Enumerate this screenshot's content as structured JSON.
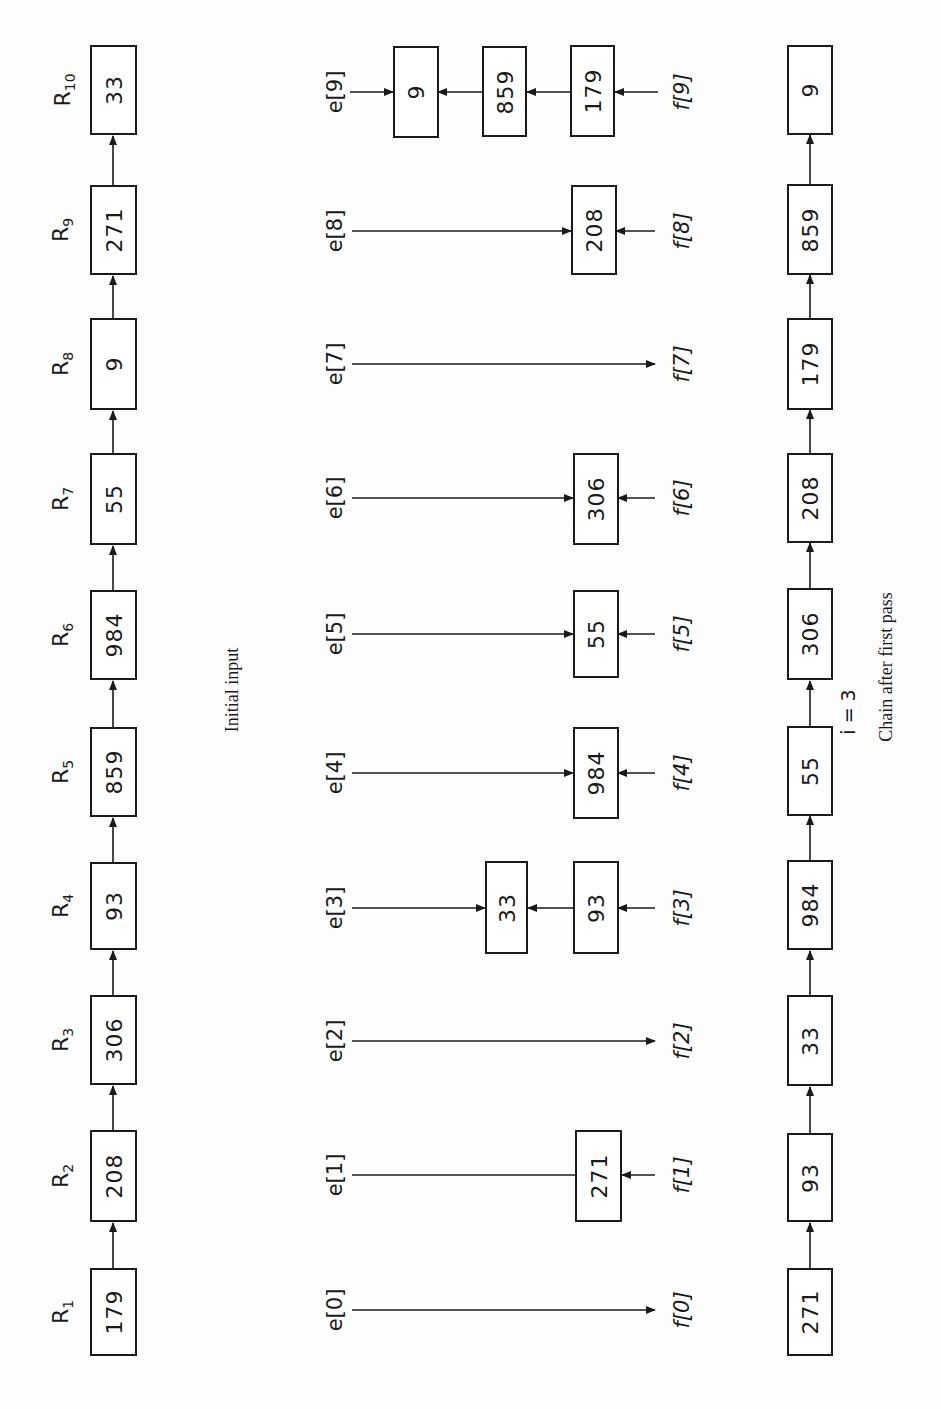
{
  "initial_input": {
    "caption": "Initial input",
    "records": [
      {
        "label": "R",
        "sub": "1",
        "value": "179"
      },
      {
        "label": "R",
        "sub": "2",
        "value": "208"
      },
      {
        "label": "R",
        "sub": "3",
        "value": "306"
      },
      {
        "label": "R",
        "sub": "4",
        "value": "93"
      },
      {
        "label": "R",
        "sub": "5",
        "value": "859"
      },
      {
        "label": "R",
        "sub": "6",
        "value": "984"
      },
      {
        "label": "R",
        "sub": "7",
        "value": "55"
      },
      {
        "label": "R",
        "sub": "8",
        "value": "9"
      },
      {
        "label": "R",
        "sub": "9",
        "value": "271"
      },
      {
        "label": "R",
        "sub": "10",
        "value": "33"
      }
    ]
  },
  "buckets": [
    {
      "e": "e[0]",
      "f": "f[0]",
      "items": []
    },
    {
      "e": "e[1]",
      "f": "f[1]",
      "items": [
        "271"
      ]
    },
    {
      "e": "e[2]",
      "f": "f[2]",
      "items": []
    },
    {
      "e": "e[3]",
      "f": "f[3]",
      "items": [
        "33",
        "93"
      ]
    },
    {
      "e": "e[4]",
      "f": "f[4]",
      "items": [
        "984"
      ]
    },
    {
      "e": "e[5]",
      "f": "f[5]",
      "items": [
        "55"
      ]
    },
    {
      "e": "e[6]",
      "f": "f[6]",
      "items": [
        "306"
      ]
    },
    {
      "e": "e[7]",
      "f": "f[7]",
      "items": []
    },
    {
      "e": "e[8]",
      "f": "f[8]",
      "items": [
        "208"
      ]
    },
    {
      "e": "e[9]",
      "f": "f[9]",
      "items": [
        "9",
        "859",
        "179"
      ]
    }
  ],
  "after_first_pass": {
    "caption": "Chain after first pass",
    "annotation": "i = 3",
    "values": [
      "271",
      "93",
      "33",
      "984",
      "55",
      "306",
      "208",
      "179",
      "859",
      "9"
    ]
  },
  "colors": {
    "ink": "#1a1a1a",
    "paper": "#fdfdfd"
  }
}
